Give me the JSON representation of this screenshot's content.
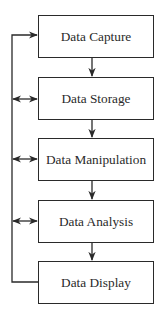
{
  "diagram": {
    "type": "flowchart",
    "direction": "top-to-bottom",
    "nodes": [
      {
        "id": "capture",
        "label": "Data Capture"
      },
      {
        "id": "storage",
        "label": "Data Storage"
      },
      {
        "id": "manipulation",
        "label": "Data Manipulation"
      },
      {
        "id": "analysis",
        "label": "Data Analysis"
      },
      {
        "id": "display",
        "label": "Data Display"
      }
    ],
    "edges": [
      {
        "from": "capture",
        "to": "storage",
        "style": "arrow"
      },
      {
        "from": "storage",
        "to": "manipulation",
        "style": "arrow"
      },
      {
        "from": "manipulation",
        "to": "analysis",
        "style": "arrow"
      },
      {
        "from": "analysis",
        "to": "display",
        "style": "arrow"
      },
      {
        "from": "display",
        "to": "capture",
        "style": "feedback-loop-arrow"
      },
      {
        "from": "feedback-line",
        "to": "storage",
        "style": "double-arrow"
      },
      {
        "from": "feedback-line",
        "to": "manipulation",
        "style": "double-arrow"
      },
      {
        "from": "feedback-line",
        "to": "analysis",
        "style": "double-arrow"
      }
    ],
    "colors": {
      "stroke": "#2a2a2a",
      "text": "#2a2a2a",
      "background": "#ffffff"
    }
  }
}
